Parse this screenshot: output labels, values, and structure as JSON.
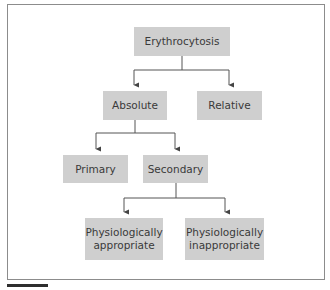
{
  "diagram": {
    "type": "flowchart-tree",
    "root": {
      "label": "Erythrocytosis",
      "children": [
        {
          "label": "Absolute",
          "children": [
            {
              "label": "Primary"
            },
            {
              "label": "Secondary",
              "children": [
                {
                  "label": "Physiologically appropriate"
                },
                {
                  "label": "Physiologically inappropriate"
                }
              ]
            }
          ]
        },
        {
          "label": "Relative"
        }
      ]
    }
  },
  "nodes": {
    "erythrocytosis": "Erythrocytosis",
    "absolute": "Absolute",
    "relative": "Relative",
    "primary": "Primary",
    "secondary": "Secondary",
    "phys_appropriate_line1": "Physiologically",
    "phys_appropriate_line2": "appropriate",
    "phys_inappropriate_line1": "Physiologically",
    "phys_inappropriate_line2": "inappropriate"
  },
  "colors": {
    "node_fill": "#cfcfcf",
    "node_text": "#3a3a3a",
    "connector": "#555555",
    "frame_border": "#8c8c8c"
  }
}
